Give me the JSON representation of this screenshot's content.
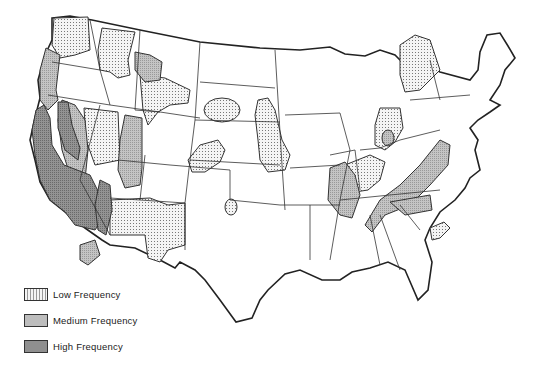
{
  "map": {
    "subject": "United States earthquake frequency zones",
    "colors": {
      "low": "#efefef",
      "medium": "#bdbdbd",
      "high": "#8f8f8f",
      "outline": "#222222"
    }
  },
  "legend": {
    "items": [
      {
        "label": "Low Frequency",
        "pattern": "dots",
        "color": "#efefef"
      },
      {
        "label": "Medium Frequency",
        "pattern": "fine",
        "color": "#bdbdbd"
      },
      {
        "label": "High Frequency",
        "pattern": "dense",
        "color": "#8f8f8f"
      }
    ]
  }
}
